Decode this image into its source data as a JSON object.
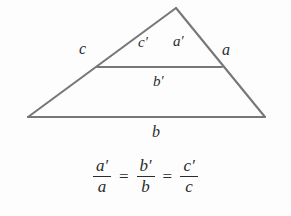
{
  "figure": {
    "background_color": "#fdfdfd",
    "stroke_color": "#77777a",
    "text_color": "#2b2b2b"
  },
  "geometry": {
    "apex": {
      "x": 176,
      "y": 8
    },
    "bottom_left": {
      "x": 28,
      "y": 117
    },
    "bottom_right": {
      "x": 265,
      "y": 117
    },
    "midline_left": {
      "x": 97,
      "y": 67
    },
    "midline_right": {
      "x": 222,
      "y": 67
    }
  },
  "labels": {
    "side_c": "c",
    "side_a": "a",
    "side_b": "b",
    "side_c_prime_base": "c",
    "side_a_prime_base": "a",
    "side_b_prime_base": "b",
    "prime_mark": "′"
  },
  "equation": {
    "terms": [
      {
        "numerator": "a",
        "numerator_prime": "′",
        "denominator": "a"
      },
      {
        "numerator": "b",
        "numerator_prime": "′",
        "denominator": "b"
      },
      {
        "numerator": "c",
        "numerator_prime": "′",
        "denominator": "c"
      }
    ],
    "relation": "=",
    "plain_text": "a′/a = b′/b = c′/c"
  }
}
